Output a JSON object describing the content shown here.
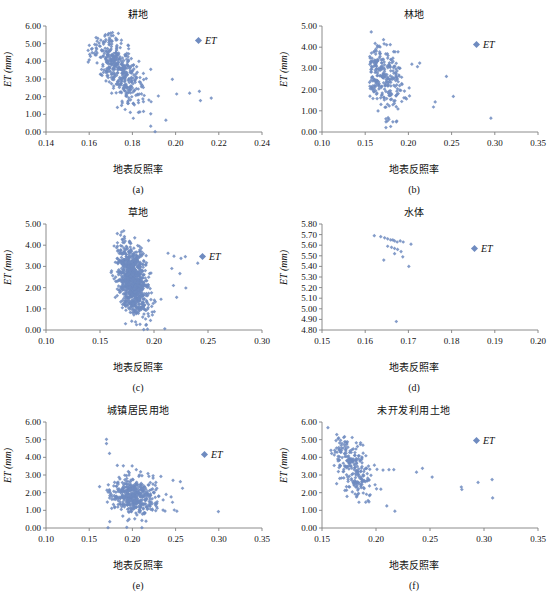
{
  "figure": {
    "marker_color": "#6f8bc0",
    "axis_color": "#808080",
    "legend_label": "ET",
    "y_axis_label": "ET (mm)",
    "x_axis_label": "地表反照率"
  },
  "chart_data": [
    {
      "type": "scatter",
      "panel": "(a)",
      "title": "耕地",
      "xlabel": "地表反照率",
      "ylabel": "ET (mm)",
      "legend": [
        "ET"
      ],
      "legend_position": "top-right",
      "grid": false,
      "xlim": [
        0.14,
        0.24
      ],
      "ylim": [
        0.0,
        6.0
      ],
      "xticks": [
        "0.14",
        "0.16",
        "0.18",
        "0.20",
        "0.22",
        "0.24"
      ],
      "yticks": [
        "0.00",
        "1.00",
        "2.00",
        "3.00",
        "4.00",
        "5.00",
        "6.00"
      ],
      "n_points": 420,
      "cluster": {
        "x_center": 0.1735,
        "x_sigma": 0.0058,
        "y_at_xcenter": 3.65,
        "slope": -115.0,
        "y_sigma": 0.78,
        "x_min": 0.158,
        "x_max": 0.218,
        "y_min": 0.0,
        "y_max": 5.7
      },
      "outliers": [
        [
          0.1595,
          4.62
        ],
        [
          0.16,
          4.08
        ],
        [
          0.1885,
          1.03
        ],
        [
          0.1885,
          0.33
        ],
        [
          0.1905,
          0.02
        ],
        [
          0.1955,
          0.67
        ],
        [
          0.2005,
          2.15
        ],
        [
          0.1985,
          2.98
        ],
        [
          0.2065,
          2.2
        ],
        [
          0.211,
          2.3
        ],
        [
          0.2115,
          1.78
        ],
        [
          0.2165,
          1.92
        ],
        [
          0.1885,
          3.55
        ],
        [
          0.178,
          1.62
        ],
        [
          0.1735,
          5.58
        ]
      ]
    },
    {
      "type": "scatter",
      "panel": "(b)",
      "title": "林地",
      "xlabel": "地表反照率",
      "ylabel": "ET (mm)",
      "legend": [
        "ET"
      ],
      "legend_position": "top-right",
      "grid": false,
      "xlim": [
        0.1,
        0.35
      ],
      "ylim": [
        0.0,
        5.0
      ],
      "xticks": [
        "0.10",
        "0.15",
        "0.20",
        "0.25",
        "0.30",
        "0.35"
      ],
      "yticks": [
        "0.00",
        "1.00",
        "2.00",
        "3.00",
        "4.00",
        "5.00"
      ],
      "n_points": 265,
      "cluster": {
        "x_center": 0.17,
        "x_sigma": 0.0135,
        "y_at_xcenter": 2.6,
        "slope": -19.0,
        "y_sigma": 0.72,
        "x_min": 0.155,
        "x_max": 0.255,
        "y_min": 0.2,
        "y_max": 4.45
      },
      "outliers": [
        [
          0.157,
          4.72
        ],
        [
          0.1615,
          4.18
        ],
        [
          0.164,
          4.08
        ],
        [
          0.179,
          4.12
        ],
        [
          0.1845,
          3.78
        ],
        [
          0.188,
          3.78
        ],
        [
          0.174,
          0.21
        ],
        [
          0.1795,
          0.26
        ],
        [
          0.186,
          0.48
        ],
        [
          0.174,
          0.62
        ],
        [
          0.1775,
          0.6
        ],
        [
          0.2955,
          0.65
        ],
        [
          0.252,
          1.68
        ],
        [
          0.244,
          2.62
        ],
        [
          0.229,
          1.18
        ],
        [
          0.231,
          1.42
        ],
        [
          0.159,
          1.58
        ],
        [
          0.204,
          3.2
        ],
        [
          0.2105,
          3.08
        ]
      ]
    },
    {
      "type": "scatter",
      "panel": "(c)",
      "title": "草地",
      "xlabel": "地表反照率",
      "ylabel": "ET (mm)",
      "legend": [
        "ET"
      ],
      "legend_position": "top-right",
      "grid": false,
      "xlim": [
        0.1,
        0.3
      ],
      "ylim": [
        0.0,
        5.0
      ],
      "xticks": [
        "0.10",
        "0.15",
        "0.20",
        "0.25",
        "0.30"
      ],
      "yticks": [
        "0.00",
        "1.00",
        "2.00",
        "3.00",
        "4.00",
        "5.00"
      ],
      "n_points": 900,
      "cluster": {
        "x_center": 0.18,
        "x_sigma": 0.0072,
        "y_at_xcenter": 2.35,
        "slope": -52.0,
        "y_sigma": 0.8,
        "x_min": 0.157,
        "x_max": 0.213,
        "y_min": 0.05,
        "y_max": 4.55
      },
      "outliers": [
        [
          0.166,
          4.55
        ],
        [
          0.17,
          4.62
        ],
        [
          0.172,
          4.68
        ],
        [
          0.195,
          4.22
        ],
        [
          0.213,
          3.62
        ],
        [
          0.2185,
          3.48
        ],
        [
          0.225,
          3.38
        ],
        [
          0.229,
          3.46
        ],
        [
          0.2405,
          3.15
        ],
        [
          0.2295,
          1.98
        ],
        [
          0.224,
          2.66
        ],
        [
          0.2165,
          2.9
        ],
        [
          0.21,
          0.06
        ],
        [
          0.194,
          0.04
        ],
        [
          0.1905,
          0.02
        ],
        [
          0.2065,
          1.45
        ],
        [
          0.221,
          1.54
        ],
        [
          0.218,
          2.1
        ]
      ]
    },
    {
      "type": "scatter",
      "panel": "(d)",
      "title": "水体",
      "xlabel": "地表反照率",
      "ylabel": "ET (mm)",
      "legend": [
        "ET"
      ],
      "legend_position": "top-right",
      "grid": false,
      "xlim": [
        0.15,
        0.2
      ],
      "ylim": [
        4.8,
        5.8
      ],
      "xticks": [
        "0.15",
        "0.16",
        "0.17",
        "0.18",
        "0.19",
        "0.20"
      ],
      "yticks": [
        "4.80",
        "4.90",
        "5.00",
        "5.10",
        "5.20",
        "5.30",
        "5.40",
        "5.50",
        "5.60",
        "5.70",
        "5.80"
      ],
      "n_points": 0,
      "points": [
        [
          0.1621,
          5.69
        ],
        [
          0.1636,
          5.68
        ],
        [
          0.1645,
          5.67
        ],
        [
          0.1652,
          5.66
        ],
        [
          0.1659,
          5.65
        ],
        [
          0.1664,
          5.65
        ],
        [
          0.1668,
          5.64
        ],
        [
          0.1674,
          5.63
        ],
        [
          0.1681,
          5.64
        ],
        [
          0.1688,
          5.63
        ],
        [
          0.1706,
          5.61
        ],
        [
          0.1652,
          5.59
        ],
        [
          0.1661,
          5.58
        ],
        [
          0.1668,
          5.57
        ],
        [
          0.1675,
          5.56
        ],
        [
          0.1683,
          5.54
        ],
        [
          0.1643,
          5.46
        ],
        [
          0.1668,
          5.52
        ],
        [
          0.1687,
          5.49
        ],
        [
          0.1701,
          5.4
        ],
        [
          0.1672,
          4.88
        ]
      ]
    },
    {
      "type": "scatter",
      "panel": "(e)",
      "title": "城镇居民用地",
      "xlabel": "地表反照率",
      "ylabel": "ET (mm)",
      "legend": [
        "ET"
      ],
      "legend_position": "top-right",
      "grid": false,
      "xlim": [
        0.1,
        0.35
      ],
      "ylim": [
        0.0,
        6.0
      ],
      "xticks": [
        "0.10",
        "0.15",
        "0.20",
        "0.25",
        "0.30",
        "0.35"
      ],
      "yticks": [
        "0.00",
        "1.00",
        "2.00",
        "3.00",
        "4.00",
        "5.00",
        "6.00"
      ],
      "n_points": 430,
      "cluster": {
        "x_center": 0.202,
        "x_sigma": 0.0148,
        "y_at_xcenter": 1.82,
        "slope": -3.5,
        "y_sigma": 0.52,
        "x_min": 0.17,
        "x_max": 0.258,
        "y_min": 0.1,
        "y_max": 3.6
      },
      "outliers": [
        [
          0.17,
          5.02
        ],
        [
          0.17,
          4.78
        ],
        [
          0.1735,
          4.22
        ],
        [
          0.1825,
          3.54
        ],
        [
          0.1895,
          3.52
        ],
        [
          0.2045,
          3.3
        ],
        [
          0.2095,
          3.18
        ],
        [
          0.233,
          2.92
        ],
        [
          0.247,
          2.7
        ],
        [
          0.2555,
          2.62
        ],
        [
          0.258,
          2.25
        ],
        [
          0.2995,
          0.93
        ],
        [
          0.162,
          2.34
        ],
        [
          0.1718,
          0.02
        ],
        [
          0.1738,
          0.36
        ],
        [
          0.1935,
          0.04
        ],
        [
          0.211,
          0.02
        ],
        [
          0.211,
          0.43
        ],
        [
          0.2485,
          1.02
        ],
        [
          0.2515,
          0.95
        ]
      ]
    },
    {
      "type": "scatter",
      "panel": "(f)",
      "title": "未开发利用土地",
      "xlabel": "地表反照率",
      "ylabel": "ET (mm)",
      "legend": [
        "ET"
      ],
      "legend_position": "top-right",
      "grid": false,
      "xlim": [
        0.15,
        0.35
      ],
      "ylim": [
        0.0,
        6.0
      ],
      "xticks": [
        "0.15",
        "0.20",
        "0.25",
        "0.30",
        "0.35"
      ],
      "yticks": [
        "0.00",
        "1.00",
        "2.00",
        "3.00",
        "4.00",
        "5.00",
        "6.00"
      ],
      "n_points": 230,
      "cluster": {
        "x_center": 0.1775,
        "x_sigma": 0.0092,
        "y_at_xcenter": 3.45,
        "slope": -62.0,
        "y_sigma": 0.86,
        "x_min": 0.158,
        "x_max": 0.205,
        "y_min": 1.4,
        "y_max": 5.3
      },
      "outliers": [
        [
          0.1555,
          5.68
        ],
        [
          0.165,
          5.05
        ],
        [
          0.1672,
          4.96
        ],
        [
          0.1735,
          4.88
        ],
        [
          0.2065,
          3.28
        ],
        [
          0.212,
          3.3
        ],
        [
          0.2165,
          3.3
        ],
        [
          0.2375,
          3.16
        ],
        [
          0.243,
          3.38
        ],
        [
          0.252,
          2.88
        ],
        [
          0.279,
          2.32
        ],
        [
          0.2795,
          2.18
        ],
        [
          0.2945,
          2.58
        ],
        [
          0.3075,
          2.74
        ],
        [
          0.308,
          1.7
        ],
        [
          0.21,
          1.25
        ],
        [
          0.2175,
          0.95
        ],
        [
          0.1935,
          1.48
        ],
        [
          0.1905,
          1.46
        ],
        [
          0.2005,
          2.22
        ],
        [
          0.2045,
          2.2
        ]
      ]
    }
  ]
}
